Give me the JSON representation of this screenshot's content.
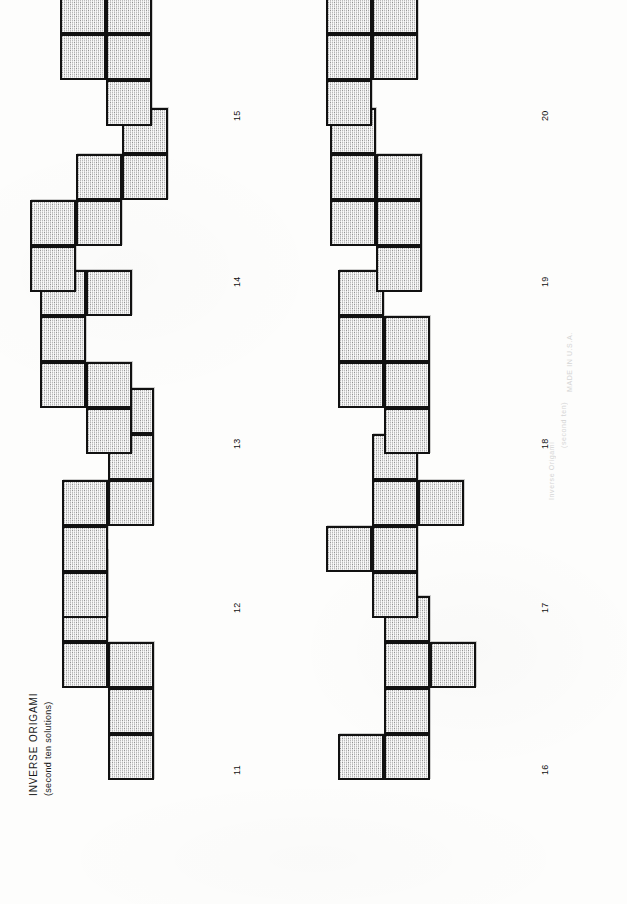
{
  "document": {
    "title": "INVERSE ORIGAMI",
    "subtitle": "(second ten solutions)",
    "orientation": "rotated-90-ccw",
    "background_color": "#fdfdfc",
    "ink_color": "#111111",
    "fill_color": "#b9b9b9",
    "ghost_text": [
      "MADE IN U.S.A.",
      "(second ten)",
      "Inverse Origami"
    ]
  },
  "legend": {
    "cell_size_px": 46,
    "note": "Each figure is a six-square polyomino (cube net)."
  },
  "figures": [
    {
      "label": "11",
      "cells": [
        [
          0,
          1
        ],
        [
          1,
          1
        ],
        [
          2,
          1
        ],
        [
          2,
          0
        ],
        [
          3,
          0
        ],
        [
          4,
          0
        ]
      ]
    },
    {
      "label": "12",
      "cells": [
        [
          0,
          0
        ],
        [
          1,
          0
        ],
        [
          2,
          0
        ],
        [
          2,
          1
        ],
        [
          3,
          1
        ],
        [
          4,
          1
        ]
      ]
    },
    {
      "label": "13",
      "cells": [
        [
          0,
          1
        ],
        [
          1,
          1
        ],
        [
          1,
          0
        ],
        [
          2,
          0
        ],
        [
          3,
          0
        ],
        [
          3,
          1
        ]
      ]
    },
    {
      "label": "14",
      "cells": [
        [
          0,
          0
        ],
        [
          1,
          0
        ],
        [
          1,
          1
        ],
        [
          2,
          1
        ],
        [
          2,
          2
        ],
        [
          3,
          2
        ]
      ]
    },
    {
      "label": "15",
      "cells": [
        [
          0,
          1
        ],
        [
          1,
          1
        ],
        [
          1,
          0
        ],
        [
          2,
          0
        ],
        [
          2,
          1
        ],
        [
          3,
          0
        ]
      ]
    },
    {
      "label": "16",
      "cells": [
        [
          0,
          0
        ],
        [
          0,
          1
        ],
        [
          1,
          1
        ],
        [
          2,
          1
        ],
        [
          2,
          2
        ],
        [
          3,
          1
        ]
      ]
    },
    {
      "label": "17",
      "cells": [
        [
          0,
          1
        ],
        [
          1,
          0
        ],
        [
          1,
          1
        ],
        [
          2,
          1
        ],
        [
          2,
          2
        ],
        [
          3,
          1
        ]
      ]
    },
    {
      "label": "18",
      "cells": [
        [
          0,
          1
        ],
        [
          1,
          0
        ],
        [
          1,
          1
        ],
        [
          2,
          0
        ],
        [
          2,
          1
        ],
        [
          3,
          0
        ]
      ]
    },
    {
      "label": "19",
      "cells": [
        [
          0,
          1
        ],
        [
          1,
          1
        ],
        [
          1,
          0
        ],
        [
          2,
          0
        ],
        [
          2,
          1
        ],
        [
          3,
          0
        ]
      ]
    },
    {
      "label": "20",
      "cells": [
        [
          0,
          0
        ],
        [
          1,
          0
        ],
        [
          1,
          1
        ],
        [
          2,
          0
        ],
        [
          2,
          1
        ],
        [
          3,
          0
        ]
      ]
    }
  ]
}
